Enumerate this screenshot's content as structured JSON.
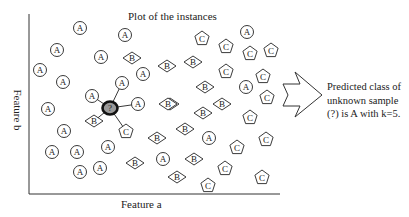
{
  "figure": {
    "title": "Plot of the instances",
    "x_axis_label": "Feature a",
    "y_axis_label": "Feature b",
    "result_text": [
      "Predicted class of",
      "unknown sample",
      "(?) is A with k=5."
    ],
    "unknown_label": "?",
    "k": 5,
    "predicted_class": "A"
  },
  "instances": {
    "A": [
      [
        80,
        28
      ],
      [
        125,
        35
      ],
      [
        57,
        50
      ],
      [
        101,
        57
      ],
      [
        40,
        70
      ],
      [
        63,
        82
      ],
      [
        143,
        74
      ],
      [
        122,
        83
      ],
      [
        92,
        96
      ],
      [
        138,
        104
      ],
      [
        48,
        109
      ],
      [
        64,
        131
      ],
      [
        52,
        152
      ],
      [
        77,
        152
      ],
      [
        108,
        147
      ],
      [
        80,
        172
      ],
      [
        100,
        168
      ],
      [
        163,
        159
      ],
      [
        209,
        138
      ],
      [
        247,
        32
      ],
      [
        246,
        87
      ]
    ],
    "B": [
      [
        132,
        58
      ],
      [
        167,
        66
      ],
      [
        193,
        62
      ],
      [
        205,
        87
      ],
      [
        170,
        104
      ],
      [
        94,
        121
      ],
      [
        168,
        104
      ],
      [
        222,
        104
      ],
      [
        203,
        113
      ],
      [
        185,
        129
      ],
      [
        157,
        138
      ],
      [
        135,
        163
      ],
      [
        194,
        159
      ],
      [
        177,
        177
      ]
    ],
    "C": [
      [
        202,
        38
      ],
      [
        226,
        46
      ],
      [
        250,
        53
      ],
      [
        271,
        50
      ],
      [
        226,
        71
      ],
      [
        263,
        76
      ],
      [
        267,
        97
      ],
      [
        126,
        131
      ],
      [
        250,
        117
      ],
      [
        266,
        139
      ],
      [
        237,
        147
      ],
      [
        225,
        168
      ],
      [
        208,
        185
      ],
      [
        262,
        177
      ]
    ]
  },
  "unknown": [
    110,
    108
  ],
  "neighbors": [
    [
      92,
      96
    ],
    [
      122,
      83
    ],
    [
      138,
      104
    ],
    [
      94,
      121
    ],
    [
      126,
      131
    ]
  ],
  "colors": {
    "stroke": "#222222",
    "unknown_fill": "#999999",
    "background": "#ffffff"
  }
}
